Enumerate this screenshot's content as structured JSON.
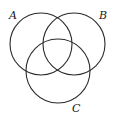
{
  "diagram": {
    "type": "venn-3",
    "stroke_color": "#2a2a2a",
    "background": "#ffffff",
    "sets": [
      {
        "label": "A",
        "cx": 41,
        "cy": 44,
        "r": 31
      },
      {
        "label": "B",
        "cx": 74,
        "cy": 44,
        "r": 31
      },
      {
        "label": "C",
        "cx": 58,
        "cy": 71,
        "r": 32
      }
    ],
    "labels": [
      {
        "text": "A",
        "x": 9,
        "y": 19
      },
      {
        "text": "B",
        "x": 99,
        "y": 19
      },
      {
        "text": "C",
        "x": 72,
        "y": 112
      }
    ]
  }
}
